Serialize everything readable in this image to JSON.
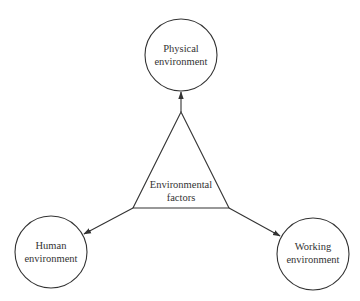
{
  "diagram": {
    "type": "hub-and-spoke",
    "colors": {
      "stroke": "#333333",
      "text": "#333333",
      "background": "#ffffff"
    },
    "center": {
      "shape": "triangle",
      "label_lines": [
        "Environmental",
        "factors"
      ]
    },
    "nodes": [
      {
        "id": "physical",
        "shape": "circle",
        "label_lines": [
          "Physical",
          "environment"
        ]
      },
      {
        "id": "human",
        "shape": "circle",
        "label_lines": [
          "Human",
          "environment"
        ]
      },
      {
        "id": "working",
        "shape": "circle",
        "label_lines": [
          "Working",
          "environment"
        ]
      }
    ],
    "edges": [
      {
        "from": "center",
        "to": "physical",
        "arrow": "to"
      },
      {
        "from": "center",
        "to": "human",
        "arrow": "to"
      },
      {
        "from": "center",
        "to": "working",
        "arrow": "to"
      }
    ]
  }
}
